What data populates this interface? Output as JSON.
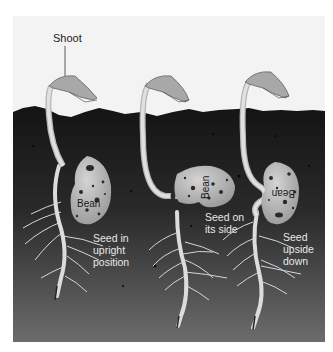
{
  "diagram": {
    "title_label": "Shoot",
    "seedlings": [
      {
        "bean_label": "Bean",
        "caption_lines": [
          "Seed in",
          "upright",
          "position"
        ],
        "orientation": "upright"
      },
      {
        "bean_label": "Bean",
        "caption_lines": [
          "Seed on",
          "its side"
        ],
        "orientation": "side"
      },
      {
        "bean_label": "Bean",
        "caption_lines": [
          "Seed",
          "upside",
          "down"
        ],
        "orientation": "upside-down"
      }
    ],
    "colors": {
      "background": "#f3f3f3",
      "soil_top": "#141414",
      "soil_bottom": "#6a6a6a",
      "stem": "#c8c8c8",
      "leaf": "#a8a8a8",
      "bean": "#b8b8b8",
      "label_text": "#222222",
      "caption_text": "#e8e8e8"
    }
  }
}
